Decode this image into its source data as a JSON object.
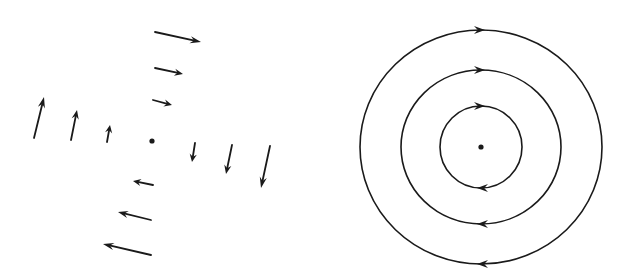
{
  "diagram": {
    "colors": {
      "stroke": "#1a1a1a",
      "background": "#ffffff"
    },
    "vector_field": {
      "center": {
        "x": 152,
        "y": 141,
        "r": 2.6
      },
      "arrows": [
        {
          "id": "top-1",
          "x1": 155,
          "y1": 32,
          "x2": 201,
          "y2": 42
        },
        {
          "id": "top-2",
          "x1": 155,
          "y1": 68,
          "x2": 183,
          "y2": 74
        },
        {
          "id": "top-3",
          "x1": 153,
          "y1": 100,
          "x2": 172,
          "y2": 105
        },
        {
          "id": "left-1",
          "x1": 34,
          "y1": 138,
          "x2": 44,
          "y2": 97
        },
        {
          "id": "left-2",
          "x1": 71,
          "y1": 140,
          "x2": 77,
          "y2": 110
        },
        {
          "id": "left-3",
          "x1": 107,
          "y1": 142,
          "x2": 110,
          "y2": 125
        },
        {
          "id": "right-1",
          "x1": 195,
          "y1": 143,
          "x2": 192,
          "y2": 162
        },
        {
          "id": "right-2",
          "x1": 232,
          "y1": 145,
          "x2": 226,
          "y2": 174
        },
        {
          "id": "right-3",
          "x1": 270,
          "y1": 146,
          "x2": 261,
          "y2": 188
        },
        {
          "id": "bottom-1",
          "x1": 153,
          "y1": 185,
          "x2": 133,
          "y2": 181
        },
        {
          "id": "bottom-2",
          "x1": 151,
          "y1": 220,
          "x2": 118,
          "y2": 212
        },
        {
          "id": "bottom-3",
          "x1": 151,
          "y1": 255,
          "x2": 103,
          "y2": 244
        }
      ]
    },
    "field_lines": {
      "center": {
        "x": 481,
        "y": 147,
        "r": 2.6
      },
      "circles": [
        {
          "id": "inner",
          "rx": 41,
          "ry": 41
        },
        {
          "id": "middle",
          "rx": 80,
          "ry": 77
        },
        {
          "id": "outer",
          "rx": 121,
          "ry": 117
        }
      ],
      "direction": "clockwise"
    }
  }
}
